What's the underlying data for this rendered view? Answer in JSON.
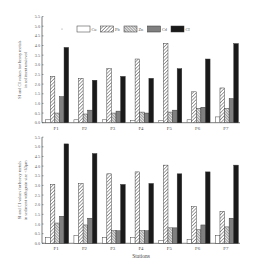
{
  "chart_data": [
    {
      "type": "bar",
      "title": "",
      "xlabel": "",
      "ylabel": "SI and CI values for heavy metals in sediment unsieved",
      "ylim": [
        0,
        5.5
      ],
      "yticks": [
        "0.0",
        "0.5",
        "1.0",
        "1.5",
        "2.0",
        "2.5",
        "3.0",
        "3.5",
        "4.0",
        "4.5",
        "5.0",
        "5.5"
      ],
      "categories": [
        "F1",
        "F2",
        "F3",
        "F4",
        "F5",
        "F6",
        "F7"
      ],
      "legend_position": "top",
      "grid": false,
      "series": [
        {
          "name": "Cu",
          "values": [
            0.15,
            0.15,
            0.15,
            0.1,
            0.1,
            0.15,
            0.3
          ]
        },
        {
          "name": "Pb",
          "values": [
            2.4,
            2.3,
            2.8,
            3.3,
            4.1,
            1.6,
            1.8
          ]
        },
        {
          "name": "Zn",
          "values": [
            0.5,
            0.45,
            0.5,
            0.55,
            0.55,
            0.75,
            0.75
          ]
        },
        {
          "name": "Cd",
          "values": [
            1.35,
            0.65,
            0.6,
            0.5,
            0.65,
            0.8,
            1.25
          ]
        },
        {
          "name": "CI",
          "values": [
            3.9,
            2.2,
            2.4,
            2.3,
            2.8,
            3.3,
            4.1
          ]
        }
      ]
    },
    {
      "type": "bar",
      "title": "",
      "xlabel": "Stations",
      "ylabel": "SI and CI values for heavy metals in sediment with grain size <63μm",
      "ylim": [
        0,
        5.5
      ],
      "yticks": [
        "0.0",
        "0.5",
        "1.0",
        "1.5",
        "2.0",
        "2.5",
        "3.0",
        "3.5",
        "4.0",
        "4.5",
        "5.0",
        "5.5"
      ],
      "categories": [
        "F1",
        "F2",
        "F3",
        "F4",
        "F5",
        "F6",
        "F7"
      ],
      "grid": false,
      "series": [
        {
          "name": "Cu",
          "values": [
            0.3,
            0.4,
            0.3,
            0.3,
            0.15,
            0.2,
            0.4
          ]
        },
        {
          "name": "Pb",
          "values": [
            3.05,
            3.1,
            3.6,
            3.7,
            4.05,
            1.9,
            1.65
          ]
        },
        {
          "name": "Zn",
          "values": [
            1.05,
            0.95,
            0.65,
            0.65,
            0.8,
            0.7,
            0.85
          ]
        },
        {
          "name": "Cd",
          "values": [
            1.4,
            1.3,
            0.65,
            0.65,
            0.8,
            0.95,
            1.3
          ]
        },
        {
          "name": "CI",
          "values": [
            5.15,
            4.65,
            3.05,
            3.1,
            3.6,
            3.7,
            4.05
          ]
        }
      ]
    }
  ],
  "legend": [
    {
      "label": "Cu",
      "fill": "white"
    },
    {
      "label": "Pb",
      "fill": "hatch-diag"
    },
    {
      "label": "Zn",
      "fill": "hatch-cross"
    },
    {
      "label": "Cd",
      "fill": "gray"
    },
    {
      "label": "CI",
      "fill": "black"
    }
  ],
  "colors": {
    "axis": "#444444",
    "cd_fill": "#8a8a8a",
    "ci_fill": "#1a1a1a",
    "bar_stroke": "#333333"
  }
}
